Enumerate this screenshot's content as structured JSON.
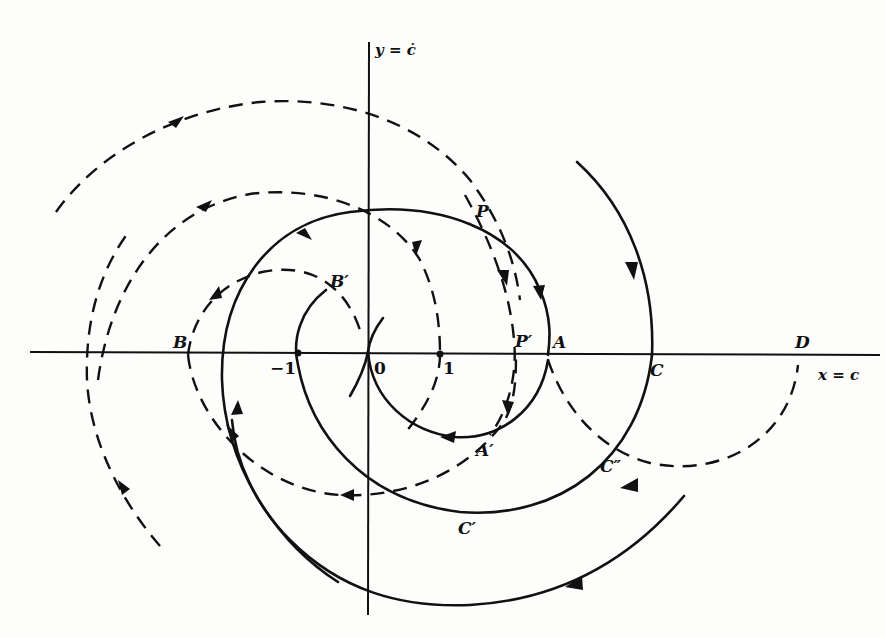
{
  "diagram": {
    "type": "phase-plane trajectories",
    "axes": {
      "x_label": "x = c",
      "y_label": "y = ċ"
    },
    "tick_labels": {
      "minus_one": "−1",
      "zero": "0",
      "one": "1"
    },
    "point_labels": {
      "P": "P",
      "P_prime": "P′",
      "A": "A",
      "A_prime": "A′",
      "B": "B",
      "B_prime": "B′",
      "C": "C",
      "C_prime": "C′",
      "C_double_prime": "C″",
      "D": "D"
    },
    "legend": {
      "solid_curves": "trajectories (solid)",
      "dashed_curves": "trajectories (dashed)"
    },
    "colors": {
      "ink": "#111111",
      "paper": "#fdfdfc"
    }
  }
}
